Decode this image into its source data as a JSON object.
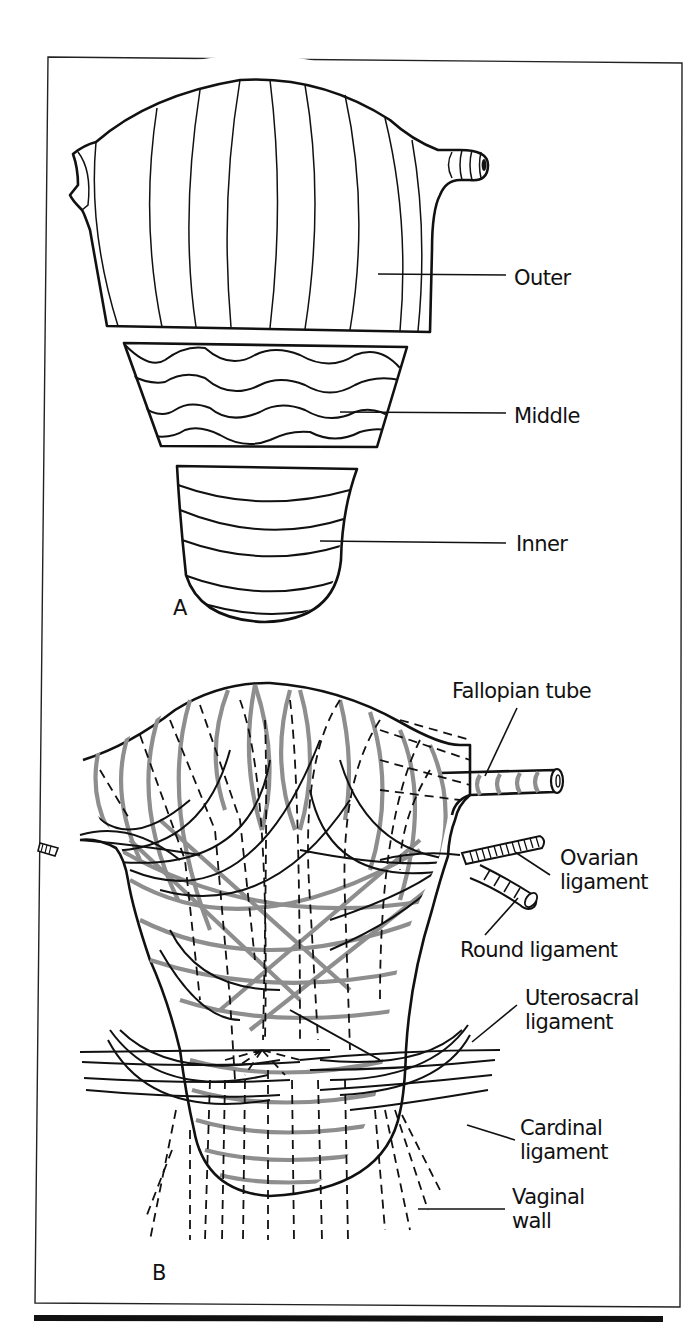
{
  "figure": {
    "panel_a": {
      "letter": "A",
      "layers": [
        {
          "id": "outer",
          "label": "Outer",
          "fill": "#ffffff",
          "fiber_pattern": "longitudinal"
        },
        {
          "id": "middle",
          "label": "Middle",
          "fill": "#c9c9c9",
          "fiber_pattern": "wavy-interlacing"
        },
        {
          "id": "inner",
          "label": "Inner",
          "fill": "#8d8d8d",
          "fiber_pattern": "circular"
        }
      ]
    },
    "panel_b": {
      "letter": "B",
      "labels": {
        "fallopian_tube": "Fallopian tube",
        "ovarian_ligament_1": "Ovarian",
        "ovarian_ligament_2": "ligament",
        "round_ligament": "Round ligament",
        "uterosacral_ligament_1": "Uterosacral",
        "uterosacral_ligament_2": "ligament",
        "cardinal_ligament_1": "Cardinal",
        "cardinal_ligament_2": "ligament",
        "vaginal_wall_1": "Vaginal",
        "vaginal_wall_2": "wall"
      },
      "colors": {
        "fiber_gray": "#8e8e8e",
        "line_black": "#111111"
      }
    }
  }
}
